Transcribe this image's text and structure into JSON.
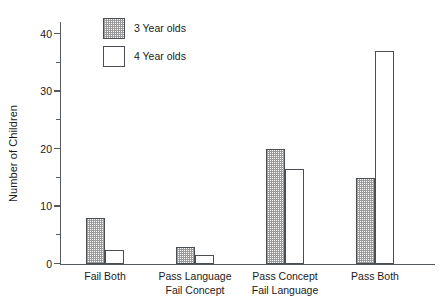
{
  "chart_data": {
    "type": "bar",
    "title": "",
    "xlabel": "",
    "ylabel": "Number of Children",
    "ylim": [
      0,
      42
    ],
    "grid": false,
    "legend_position": "top-left-inside",
    "y_major_ticks": [
      0,
      10,
      20,
      30,
      40
    ],
    "y_minor_ticks": [
      5,
      15,
      25,
      35
    ],
    "y_tick_labels": [
      "0",
      "10",
      "20",
      "30",
      "40"
    ],
    "categories": [
      {
        "line1": "Fail Both",
        "line2": ""
      },
      {
        "line1": "Pass Language",
        "line2": "Fail Concept"
      },
      {
        "line1": "Pass Concept",
        "line2": "Fail Language"
      },
      {
        "line1": "Pass Both",
        "line2": ""
      }
    ],
    "series": [
      {
        "name": "3 Year olds",
        "fill": "stipple",
        "values": [
          8,
          3,
          20,
          15
        ]
      },
      {
        "name": "4 Year olds",
        "fill": "white",
        "values": [
          2.5,
          1.5,
          16.5,
          37
        ]
      }
    ]
  },
  "legend": {
    "items": [
      {
        "label": "3 Year olds"
      },
      {
        "label": "4 Year olds"
      }
    ]
  },
  "colors": {
    "axis": "#555a5e",
    "bar_outline": "#4a4f53",
    "stipple": "#9a9a9a",
    "background": "#ffffff",
    "text": "#1a1a1a"
  }
}
